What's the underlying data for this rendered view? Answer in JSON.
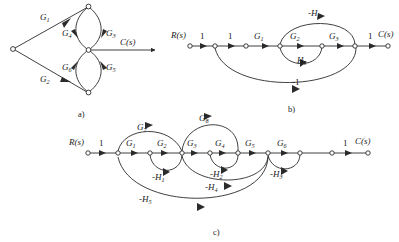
{
  "figure": {
    "panels": [
      {
        "id": "a",
        "caption": "a)",
        "input_label": "R(s)",
        "output_label": "C(s)",
        "branch_labels": [
          "G1",
          "G2",
          "G3",
          "G4",
          "G5",
          "G6"
        ],
        "branches": [
          {
            "label_base": "G",
            "label_sub": "1",
            "from": "R(s)",
            "to": "top-node"
          },
          {
            "label_base": "G",
            "label_sub": "4",
            "from": "top-node",
            "to": "mid-node"
          },
          {
            "label_base": "G",
            "label_sub": "3",
            "from": "top-node",
            "to": "mid-node"
          },
          {
            "label_base": "G",
            "label_sub": "2",
            "from": "R(s)",
            "to": "bottom-node"
          },
          {
            "label_base": "G",
            "label_sub": "6",
            "from": "bottom-node",
            "to": "mid-node"
          },
          {
            "label_base": "G",
            "label_sub": "5",
            "from": "bottom-node",
            "to": "mid-node"
          },
          {
            "label_base": "C(s)",
            "label_sub": "",
            "from": "mid-node",
            "to": "output"
          }
        ]
      },
      {
        "id": "b",
        "caption": "b)",
        "input_label": "R(s)",
        "output_label": "C(s)",
        "forward_labels": [
          "1",
          "1",
          "G1",
          "G2",
          "G3",
          "1"
        ],
        "feedback_labels": [
          "H1",
          "-H2",
          "-1"
        ],
        "branches": [
          {
            "label_base": "1",
            "label_sub": ""
          },
          {
            "label_base": "1",
            "label_sub": ""
          },
          {
            "label_base": "G",
            "label_sub": "1"
          },
          {
            "label_base": "G",
            "label_sub": "2"
          },
          {
            "label_base": "G",
            "label_sub": "3"
          },
          {
            "label_base": "1",
            "label_sub": ""
          },
          {
            "label_base": "H",
            "label_sub": "1"
          },
          {
            "label_base": "-H",
            "label_sub": "2"
          },
          {
            "label_base": "-1",
            "label_sub": ""
          }
        ]
      },
      {
        "id": "c",
        "caption": "c)",
        "input_label": "R(s)",
        "output_label": "C(s)",
        "forward_labels": [
          "1",
          "G1",
          "G2",
          "G3",
          "G4",
          "G5",
          "G6",
          "1"
        ],
        "bypass_labels": [
          "G7",
          "G8"
        ],
        "feedback_labels": [
          "-H1",
          "-H2",
          "-H3",
          "-H4",
          "-H5"
        ],
        "branches": [
          {
            "label_base": "1",
            "label_sub": ""
          },
          {
            "label_base": "G",
            "label_sub": "1"
          },
          {
            "label_base": "G",
            "label_sub": "2"
          },
          {
            "label_base": "G",
            "label_sub": "3"
          },
          {
            "label_base": "G",
            "label_sub": "4"
          },
          {
            "label_base": "G",
            "label_sub": "5"
          },
          {
            "label_base": "G",
            "label_sub": "6"
          },
          {
            "label_base": "1",
            "label_sub": ""
          },
          {
            "label_base": "G",
            "label_sub": "7"
          },
          {
            "label_base": "G",
            "label_sub": "8"
          },
          {
            "label_base": "-H",
            "label_sub": "1"
          },
          {
            "label_base": "-H",
            "label_sub": "2"
          },
          {
            "label_base": "-H",
            "label_sub": "3"
          },
          {
            "label_base": "-H",
            "label_sub": "4"
          },
          {
            "label_base": "-H",
            "label_sub": "5"
          }
        ]
      }
    ]
  },
  "labels": {
    "R_of_s": "R(s)",
    "C_of_s": "C(s)",
    "one": "1",
    "minus_one": "-1",
    "G": "G",
    "H": "H",
    "minusH": "-H",
    "s1": "1",
    "s2": "2",
    "s3": "3",
    "s4": "4",
    "s5": "5",
    "s6": "6",
    "s7": "7",
    "s8": "8",
    "cap_a": "a)",
    "cap_b": "b)",
    "cap_c": "c)"
  },
  "colors": {
    "stroke": "#2b2b2b",
    "text": "#1a1a1a",
    "background": "#ffffff"
  }
}
